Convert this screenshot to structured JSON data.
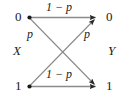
{
  "diagram": {
    "background_color": "#ffffff",
    "line_color": "#8a8a8a",
    "arrow_color": "#262626",
    "node_color": "#1a1a1a",
    "text_color": "#1a1a1a",
    "input_variable": "X",
    "output_variable": "Y",
    "input_nodes": [
      {
        "label": "0",
        "x": 29,
        "y": 17
      },
      {
        "label": "1",
        "x": 29,
        "y": 86
      }
    ],
    "output_nodes": [
      {
        "label": "0",
        "x": 100,
        "y": 17
      },
      {
        "label": "1",
        "x": 100,
        "y": 86
      }
    ],
    "edges": [
      {
        "name": "edge-0-to-0",
        "from": "0",
        "to": "0",
        "label": "1 − p",
        "kind": "horizontal"
      },
      {
        "name": "edge-0-to-1",
        "from": "0",
        "to": "1",
        "label": "p",
        "kind": "diagonal"
      },
      {
        "name": "edge-1-to-0",
        "from": "1",
        "to": "0",
        "label": "p",
        "kind": "diagonal"
      },
      {
        "name": "edge-1-to-1",
        "from": "1",
        "to": "1",
        "label": "1 − p",
        "kind": "horizontal"
      }
    ],
    "labels": {
      "top_transition": "1 − p",
      "bottom_transition": "1 − p",
      "left_crossover": "p",
      "right_crossover": "p"
    }
  }
}
